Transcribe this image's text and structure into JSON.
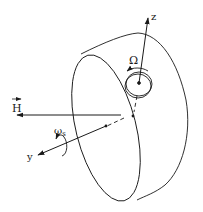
{
  "diagram": {
    "labels": {
      "H": "H",
      "z": "z",
      "y": "y",
      "Omega": "Ω",
      "omega": "ω",
      "omega_sub": "s"
    },
    "colors": {
      "stroke": "#1a1a1a",
      "background": "#ffffff"
    }
  }
}
